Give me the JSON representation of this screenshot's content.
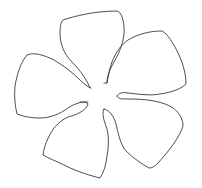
{
  "figure": {
    "title": "Five-petal flower outline",
    "stroke_color": "#3a3a3a",
    "fill_color": "#ffffff",
    "background_color": "#ffffff",
    "petal_count": 5
  }
}
